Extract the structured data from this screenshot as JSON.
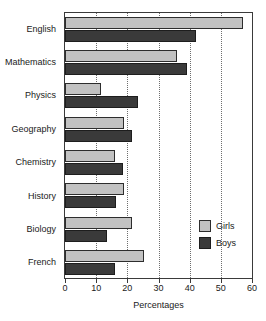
{
  "chart_data": {
    "type": "bar",
    "orientation": "horizontal",
    "title": "",
    "xlabel": "Percentages",
    "ylabel": "",
    "xlim": [
      0,
      60
    ],
    "xticks": [
      0,
      10,
      20,
      30,
      40,
      50,
      60
    ],
    "xtick_labels": [
      "0",
      "10",
      "20",
      "30",
      "40",
      "50",
      "60"
    ],
    "grid": "vertical-dotted",
    "legend_position": "inside-right-lower",
    "categories": [
      "English",
      "Mathematics",
      "Physics",
      "Geography",
      "Chemistry",
      "History",
      "Biology",
      "French"
    ],
    "series": [
      {
        "name": "Girls",
        "color": "#c2c2c2",
        "values": [
          57,
          36,
          11.5,
          19,
          16,
          19,
          21.5,
          25.5
        ]
      },
      {
        "name": "Boys",
        "color": "#3a3a3a",
        "values": [
          42,
          39,
          23.5,
          21.5,
          18.5,
          16.5,
          13.5,
          16
        ]
      }
    ]
  },
  "axis": {
    "x_title": "Percentages"
  },
  "legend": {
    "items": [
      {
        "label": "Girls",
        "swatch": "girls-swatch"
      },
      {
        "label": "Boys",
        "swatch": "boys-swatch"
      }
    ]
  },
  "colors": {
    "girls": "#c2c2c2",
    "boys": "#3a3a3a",
    "frame": "#3a3a3a",
    "grid": "#6e6e6e",
    "background": "#ffffff"
  }
}
